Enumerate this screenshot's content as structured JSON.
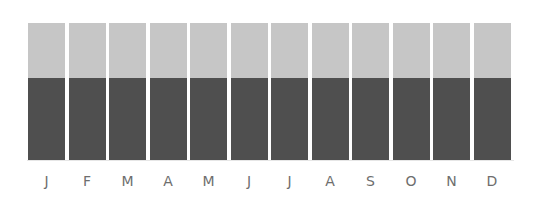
{
  "chart_data": {
    "type": "bar",
    "stacked": true,
    "title": "",
    "xlabel": "",
    "ylabel": "",
    "categories": [
      "J",
      "F",
      "M",
      "A",
      "M",
      "J",
      "J",
      "A",
      "S",
      "O",
      "N",
      "D"
    ],
    "series": [
      {
        "name": "lower (dark)",
        "color": "#4f4f4f",
        "values": [
          60,
          60,
          60,
          60,
          60,
          60,
          60,
          60,
          60,
          60,
          60,
          60
        ]
      },
      {
        "name": "upper (light)",
        "color": "#c6c6c6",
        "values": [
          40,
          40,
          40,
          40,
          40,
          40,
          40,
          40,
          40,
          40,
          40,
          40
        ]
      }
    ],
    "ylim": [
      0,
      100
    ],
    "grid": false,
    "legend": "none",
    "y_axis_visible": false
  }
}
